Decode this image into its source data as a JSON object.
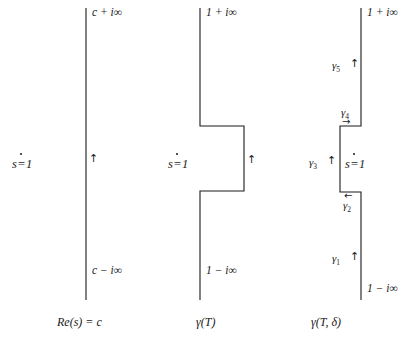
{
  "figure": {
    "title": "",
    "background_color": "#ffffff",
    "line_color": "#1a1a1a",
    "width": 418,
    "height": 345
  },
  "panels": [
    {
      "id": "panel-1",
      "caption": "Re(s) = c",
      "top_label": "c + i∞",
      "bottom_label": "c − i∞",
      "pole_label_prefix": "s",
      "pole_label_suffix": "1",
      "pole_label_relation": "=",
      "direction_arrow": "↑"
    },
    {
      "id": "panel-2",
      "caption": "γ(T)",
      "top_label": "1 + i∞",
      "bottom_label": "1 − i∞",
      "pole_label_prefix": "s",
      "pole_label_suffix": "1",
      "pole_label_relation": "=",
      "direction_arrow": "↑"
    },
    {
      "id": "panel-3",
      "caption": "γ(T, δ)",
      "top_label": "1 + i∞",
      "bottom_label": "1 − i∞",
      "pole_label_prefix": "s",
      "pole_label_suffix": "1",
      "pole_label_relation": "=",
      "segments": [
        {
          "name": "gamma-1",
          "label": "γ",
          "index": "1",
          "arrow": "↑",
          "arrow_dir": "up"
        },
        {
          "name": "gamma-2",
          "label": "γ",
          "index": "2",
          "arrow": "←",
          "arrow_dir": "left"
        },
        {
          "name": "gamma-3",
          "label": "γ",
          "index": "3",
          "arrow": "↑",
          "arrow_dir": "up"
        },
        {
          "name": "gamma-4",
          "label": "γ",
          "index": "4",
          "arrow": "→",
          "arrow_dir": "right"
        },
        {
          "name": "gamma-5",
          "label": "γ",
          "index": "5",
          "arrow": "↑",
          "arrow_dir": "up"
        }
      ]
    }
  ]
}
